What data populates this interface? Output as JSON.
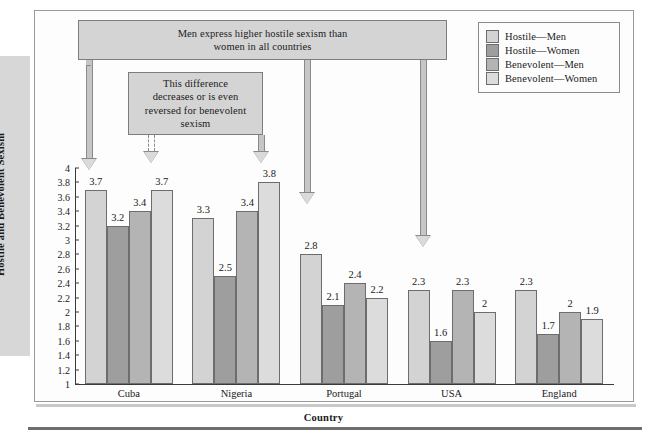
{
  "chart_data": {
    "type": "bar",
    "title": "",
    "xlabel": "Country",
    "ylabel": "Hostile and Benevolent Sexism",
    "ylim": [
      1,
      4
    ],
    "ytick_step": 0.2,
    "grid": false,
    "legend_position": "top-right",
    "categories": [
      "Cuba",
      "Nigeria",
      "Portugal",
      "USA",
      "England"
    ],
    "yticks": [
      "4",
      "3.8",
      "3.6",
      "3.4",
      "3.2",
      "3",
      "2.8",
      "2.6",
      "2.4",
      "2.2",
      "2",
      "1.8",
      "1.6",
      "1.4",
      "1.2",
      "1"
    ],
    "series": [
      {
        "name": "Hostile—Men",
        "color": "#d3d3d3",
        "values": [
          3.7,
          3.3,
          2.8,
          2.3,
          2.3
        ],
        "labels": [
          "3.7",
          "3.3",
          "2.8",
          "2.3",
          "2.3"
        ]
      },
      {
        "name": "Hostile—Women",
        "color": "#9e9e9e",
        "values": [
          3.2,
          2.5,
          2.1,
          1.6,
          1.7
        ],
        "labels": [
          "3.2",
          "2.5",
          "2.1",
          "1.6",
          "1.7"
        ]
      },
      {
        "name": "Benevolent—Men",
        "color": "#b4b4b4",
        "values": [
          3.4,
          3.4,
          2.4,
          2.3,
          2.0
        ],
        "labels": [
          "3.4",
          "3.4",
          "2.4",
          "2.3",
          "2"
        ]
      },
      {
        "name": "Benevolent—Women",
        "color": "#dcdcdc",
        "values": [
          3.7,
          3.8,
          2.2,
          2.0,
          1.9
        ],
        "labels": [
          "3.7",
          "3.8",
          "2.2",
          "2",
          "1.9"
        ]
      }
    ],
    "annotations": [
      {
        "name": "hostile-sexism-callout",
        "text": "Men express higher hostile sexism than women in all countries"
      },
      {
        "name": "benevolent-sexism-callout",
        "text": "This difference decreases or is even reversed for benevolent sexism"
      }
    ]
  },
  "legend": {
    "items": [
      {
        "label": "Hostile—Men",
        "color": "#d3d3d3"
      },
      {
        "label": "Hostile—Women",
        "color": "#9e9e9e"
      },
      {
        "label": "Benevolent—Men",
        "color": "#b4b4b4"
      },
      {
        "label": "Benevolent—Women",
        "color": "#dcdcdc"
      }
    ]
  },
  "callouts": {
    "top": {
      "line1": "Men express higher hostile sexism than",
      "line2": "women in all countries"
    },
    "inner": {
      "line1": "This difference",
      "line2": "decreases or is even",
      "line3": "reversed for benevolent",
      "line4": "sexism"
    }
  },
  "axes": {
    "ylabel": "Hostile and Benevolent Sexism",
    "xlabel": "Country"
  }
}
